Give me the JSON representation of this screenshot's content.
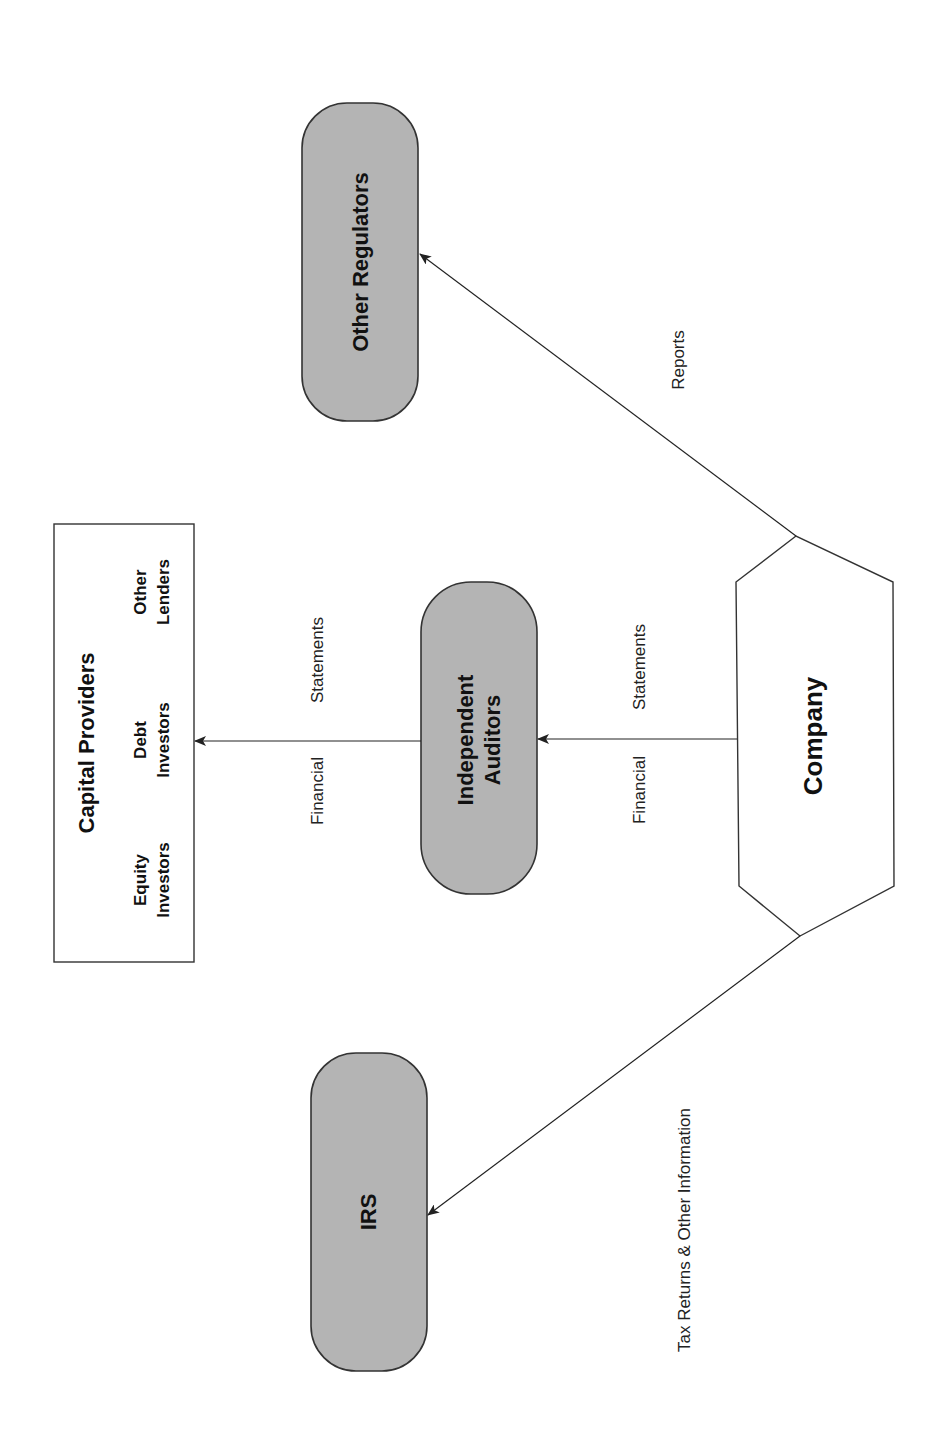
{
  "diagram": {
    "orientation": "rotated-90-ccw",
    "nodes": {
      "capital_providers": {
        "title": "Capital Providers",
        "members": [
          {
            "line1": "Equity",
            "line2": "Investors"
          },
          {
            "line1": "Debt",
            "line2": "Investors"
          },
          {
            "line1": "Other",
            "line2": "Lenders"
          }
        ]
      },
      "independent_auditors": {
        "line1": "Independent",
        "line2": "Auditors"
      },
      "other_regulators": {
        "label": "Other Regulators"
      },
      "irs": {
        "label": "IRS"
      },
      "company": {
        "label": "Company"
      }
    },
    "edges": {
      "auditors_to_capital": {
        "left": "Financial",
        "right": "Statements"
      },
      "company_to_auditors": {
        "left": "Financial",
        "right": "Statements"
      },
      "company_to_regulators": {
        "label": "Reports"
      },
      "company_to_irs": {
        "label": "Tax Returns & Other Information"
      }
    },
    "colors": {
      "node_fill": "#b4b4b4",
      "stroke": "#333333",
      "background": "#ffffff"
    }
  }
}
